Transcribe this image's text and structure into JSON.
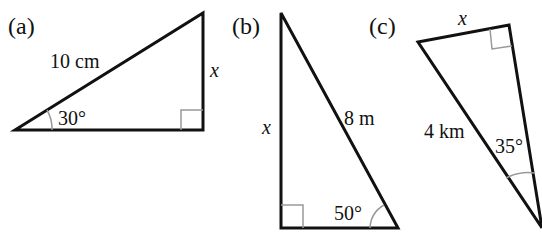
{
  "figures": [
    {
      "id": "a",
      "label": "(a)",
      "hypotenuse": "10 cm",
      "unknown": "x",
      "angle": "30°",
      "right_angle_at": "bottom-right"
    },
    {
      "id": "b",
      "label": "(b)",
      "hypotenuse": "8 m",
      "unknown": "x",
      "angle": "50°",
      "right_angle_at": "bottom-left"
    },
    {
      "id": "c",
      "label": "(c)",
      "hypotenuse": "4 km",
      "unknown": "x",
      "angle": "35°",
      "right_angle_at": "top-right"
    }
  ],
  "colors": {
    "stroke": "#111111",
    "marker": "#999999"
  }
}
